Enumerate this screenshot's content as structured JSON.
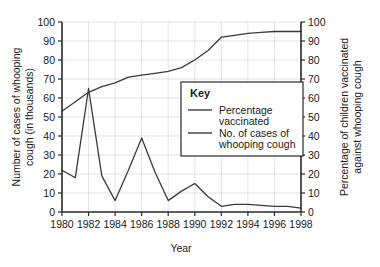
{
  "chart_data": {
    "type": "line",
    "title": "",
    "xlabel": "Year",
    "ylabel": "Number of cases of whooping cough (in thousands)",
    "y2label": "Percentage of children vaccinated against whooping cough",
    "grid": true,
    "legend_position": "inside-right",
    "legend_title": "Key",
    "xlim": [
      1980,
      1998
    ],
    "ylim": [
      0,
      100
    ],
    "y2lim": [
      0,
      100
    ],
    "x": [
      1980,
      1981,
      1982,
      1983,
      1984,
      1985,
      1986,
      1987,
      1988,
      1989,
      1990,
      1991,
      1992,
      1993,
      1994,
      1995,
      1996,
      1997,
      1998
    ],
    "xticks": [
      "1980",
      "1982",
      "1984",
      "1986",
      "1988",
      "1990",
      "1992",
      "1994",
      "1996",
      "1998"
    ],
    "xtick_values": [
      1980,
      1982,
      1984,
      1986,
      1988,
      1990,
      1992,
      1994,
      1996,
      1998
    ],
    "yticks": [
      "0",
      "10",
      "20",
      "30",
      "40",
      "50",
      "60",
      "70",
      "80",
      "90",
      "100"
    ],
    "ytick_values": [
      0,
      10,
      20,
      30,
      40,
      50,
      60,
      70,
      80,
      90,
      100
    ],
    "y2ticks": [
      "0",
      "10",
      "20",
      "30",
      "40",
      "50",
      "60",
      "70",
      "80",
      "90",
      "100"
    ],
    "y2tick_values": [
      0,
      10,
      20,
      30,
      40,
      50,
      60,
      70,
      80,
      90,
      100
    ],
    "series": [
      {
        "name": "Percentage vaccinated",
        "axis": "right",
        "color": "#3a3a3a",
        "values": [
          53,
          58,
          63,
          66,
          68,
          71,
          72,
          73,
          74,
          76,
          80,
          85,
          92,
          93,
          94,
          94.5,
          95,
          95,
          95
        ]
      },
      {
        "name": "No. of cases of whooping cough",
        "axis": "left",
        "color": "#3a3a3a",
        "values": [
          22,
          18,
          65,
          19,
          6,
          22,
          39,
          21,
          6,
          11,
          15,
          8,
          3,
          4,
          4,
          3.5,
          3,
          3,
          2
        ]
      }
    ]
  },
  "axes": {
    "left_title_line1": "Number of cases of whooping",
    "left_title_line2": "cough (in thousands)",
    "right_title_line1": "Percentage of children vaccinated",
    "right_title_line2": "against whooping cough",
    "x_title": "Year"
  },
  "key": {
    "title": "Key",
    "entries": [
      {
        "line1": "Percentage",
        "line2": "vaccinated"
      },
      {
        "line1": "No. of cases of",
        "line2": "whooping cough"
      }
    ]
  },
  "colors": {
    "line": "#3a3a3a",
    "axis": "#2a2a2a",
    "grid": "#d8d8d8",
    "background": "#ffffff"
  }
}
